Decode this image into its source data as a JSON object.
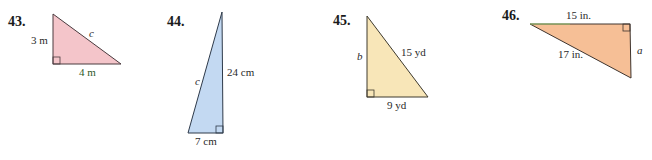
{
  "problems": [
    {
      "number": "43.",
      "fill": "#f4c5ca",
      "labels": {
        "leg_vertical": "3 m",
        "leg_horizontal": "4 m",
        "hypotenuse": "c"
      }
    },
    {
      "number": "44.",
      "fill": "#c3d9f2",
      "labels": {
        "leg_vertical": "24 cm",
        "leg_horizontal": "7 cm",
        "hypotenuse": "c"
      }
    },
    {
      "number": "45.",
      "fill": "#f8e6b8",
      "labels": {
        "leg_vertical": "b",
        "leg_horizontal": "9 yd",
        "hypotenuse": "15 yd"
      }
    },
    {
      "number": "46.",
      "fill": "#f6bf96",
      "labels": {
        "leg_horizontal": "15 in.",
        "leg_vertical": "a",
        "hypotenuse": "17 in."
      }
    }
  ]
}
